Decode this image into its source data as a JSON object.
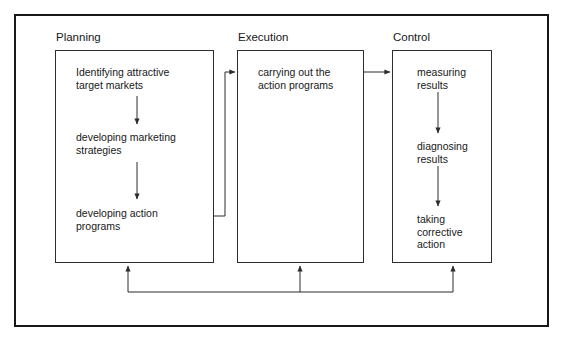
{
  "diagram": {
    "columns": [
      {
        "label": "Planning",
        "steps": [
          "Identifying attractive\ntarget markets",
          "developing marketing\nstrategies",
          "developing action\nprograms"
        ]
      },
      {
        "label": "Execution",
        "steps": [
          "carrying out the\naction programs"
        ]
      },
      {
        "label": "Control",
        "steps": [
          "measuring\nresults",
          "diagnosing\nresults",
          "taking\ncorrective\naction"
        ]
      }
    ],
    "colors": {
      "frame": "#17181a",
      "box_border": "#2a2c2e",
      "text": "#17181a",
      "arrow": "#2a2c2e",
      "background": "#ffffff"
    }
  }
}
